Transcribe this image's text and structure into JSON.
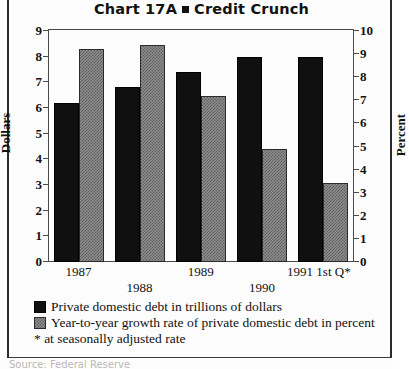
{
  "chart_data": {
    "type": "bar",
    "title_prefix": "Chart 17A",
    "title_suffix": "Credit Crunch",
    "title_bullet": "square-bullet",
    "categories": [
      "1987",
      "1988",
      "1989",
      "1990",
      "1991 1st Q*"
    ],
    "series": [
      {
        "name": "Private domestic debt in trillions of dollars",
        "axis": "left",
        "unit": "trillions of dollars",
        "values": [
          6.2,
          6.8,
          7.4,
          8.0,
          8.0
        ],
        "swatch": "dark"
      },
      {
        "name": "Year-to-year growth rate of private domestic debt in percent",
        "axis": "right",
        "unit": "percent",
        "values": [
          9.2,
          9.4,
          7.2,
          4.9,
          3.4
        ],
        "swatch": "hatched"
      }
    ],
    "xlabel": "",
    "ylabel": "Dollars",
    "ylabel_right": "Percent",
    "ylim": [
      0,
      9
    ],
    "ylim_right": [
      0,
      10
    ],
    "yticks": [
      0,
      1,
      2,
      3,
      4,
      5,
      6,
      7,
      8,
      9
    ],
    "yticks_right": [
      0,
      1,
      2,
      3,
      4,
      5,
      6,
      7,
      8,
      9,
      10
    ],
    "grid": false,
    "legend_position": "below"
  },
  "axes": {
    "left_title": "Dollars",
    "right_title": "Percent",
    "left_ticks": [
      "9",
      "8",
      "7",
      "6",
      "5",
      "4",
      "3",
      "2",
      "1",
      "0"
    ],
    "right_ticks": [
      "10",
      "9",
      "8",
      "7",
      "6",
      "5",
      "4",
      "3",
      "2",
      "1",
      "0"
    ]
  },
  "xaxis": {
    "labels": [
      {
        "text": "1987",
        "row": "top"
      },
      {
        "text": "1988",
        "row": "bottom"
      },
      {
        "text": "1989",
        "row": "top"
      },
      {
        "text": "1990",
        "row": "bottom"
      },
      {
        "text": "1991 1st Q*",
        "row": "top"
      }
    ]
  },
  "legend": {
    "items": [
      {
        "swatch": "dark",
        "label": "Private domestic debt in trillions of dollars"
      },
      {
        "swatch": "hatched",
        "label": "Year-to-year growth rate of private domestic debt in percent"
      }
    ],
    "footnote": "* at seasonally adjusted rate"
  },
  "source": {
    "text": "Source: Federal Reserve"
  }
}
